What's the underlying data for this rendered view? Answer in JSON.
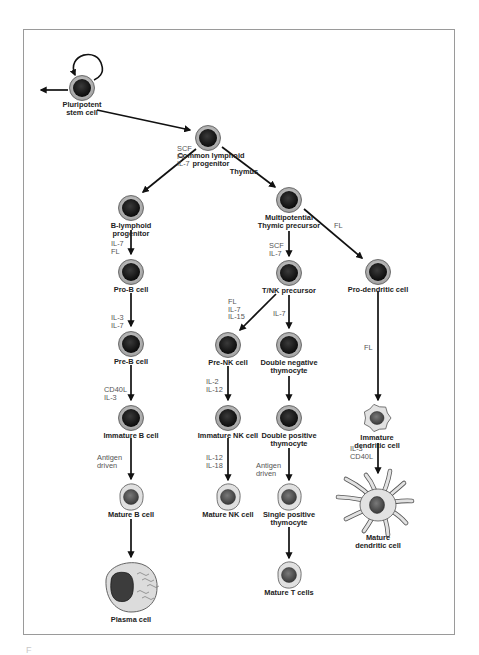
{
  "figure": {
    "caption_partial": "F"
  },
  "cells": [
    {
      "id": "psc",
      "label_lines": [
        "Pluripotent",
        "stem cell"
      ],
      "type": "progenitor"
    },
    {
      "id": "clp",
      "label_lines": [
        "Common lymphoid",
        "progenitor"
      ],
      "type": "progenitor"
    },
    {
      "id": "blp",
      "label_lines": [
        "B-lymphoid",
        "progenitor"
      ],
      "type": "progenitor"
    },
    {
      "id": "prob",
      "label_lines": [
        "Pro-B cell"
      ],
      "type": "progenitor"
    },
    {
      "id": "preb",
      "label_lines": [
        "Pre-B cell"
      ],
      "type": "progenitor"
    },
    {
      "id": "immb",
      "label_lines": [
        "Immature B cell"
      ],
      "type": "progenitor"
    },
    {
      "id": "matb",
      "label_lines": [
        "Mature B cell"
      ],
      "type": "mature"
    },
    {
      "id": "plasma",
      "label_lines": [
        "Plasma cell"
      ],
      "type": "plasma"
    },
    {
      "id": "mtp",
      "label_lines": [
        "Multipotential",
        "Thymic precursor"
      ],
      "type": "progenitor"
    },
    {
      "id": "tnk",
      "label_lines": [
        "T/NK precursor"
      ],
      "type": "progenitor"
    },
    {
      "id": "prenk",
      "label_lines": [
        "Pre-NK cell"
      ],
      "type": "progenitor"
    },
    {
      "id": "immnk",
      "label_lines": [
        "Immature NK cell"
      ],
      "type": "progenitor"
    },
    {
      "id": "matnk",
      "label_lines": [
        "Mature NK cell"
      ],
      "type": "mature"
    },
    {
      "id": "dnt",
      "label_lines": [
        "Double negative",
        "thymocyte"
      ],
      "type": "progenitor"
    },
    {
      "id": "dpt",
      "label_lines": [
        "Double positive",
        "thymocyte"
      ],
      "type": "progenitor"
    },
    {
      "id": "spt",
      "label_lines": [
        "Single positive",
        "thymocyte"
      ],
      "type": "mature"
    },
    {
      "id": "matt",
      "label_lines": [
        "Mature T cells"
      ],
      "type": "mature"
    },
    {
      "id": "prodc",
      "label_lines": [
        "Pro-dendritic cell"
      ],
      "type": "progenitor"
    },
    {
      "id": "immdc",
      "label_lines": [
        "Immature",
        "dendritic cell"
      ],
      "type": "immature-dc"
    },
    {
      "id": "matdc",
      "label_lines": [
        "Mature",
        "dendritic cell"
      ],
      "type": "mature-dc"
    }
  ],
  "transitions": [
    {
      "from": "psc",
      "to": "psc",
      "kind": "self-renewal",
      "factors": []
    },
    {
      "from": "psc",
      "to": "other-lineages",
      "kind": "exit",
      "factors": []
    },
    {
      "from": "psc",
      "to": "clp",
      "factors": []
    },
    {
      "from": "clp",
      "to": "blp",
      "factors": [
        "SCF",
        "FL",
        "IL-7"
      ]
    },
    {
      "from": "clp",
      "to": "mtp",
      "factors": [
        "Thymus"
      ]
    },
    {
      "from": "blp",
      "to": "prob",
      "factors": [
        "IL-7",
        "FL"
      ]
    },
    {
      "from": "prob",
      "to": "preb",
      "factors": [
        "IL-3",
        "IL-7"
      ]
    },
    {
      "from": "preb",
      "to": "immb",
      "factors": [
        "CD40L",
        "IL-3"
      ]
    },
    {
      "from": "immb",
      "to": "matb",
      "factors": [
        "Antigen",
        "driven"
      ]
    },
    {
      "from": "matb",
      "to": "plasma",
      "factors": []
    },
    {
      "from": "mtp",
      "to": "tnk",
      "factors": [
        "SCF",
        "IL-7"
      ]
    },
    {
      "from": "mtp",
      "to": "prodc",
      "factors": [
        "FL"
      ]
    },
    {
      "from": "tnk",
      "to": "prenk",
      "factors": [
        "FL",
        "IL-7",
        "IL-15"
      ]
    },
    {
      "from": "tnk",
      "to": "dnt",
      "factors": [
        "IL-7"
      ]
    },
    {
      "from": "prenk",
      "to": "immnk",
      "factors": [
        "IL-2",
        "IL-12"
      ]
    },
    {
      "from": "immnk",
      "to": "matnk",
      "factors": [
        "IL-12",
        "IL-18"
      ]
    },
    {
      "from": "dnt",
      "to": "dpt",
      "factors": []
    },
    {
      "from": "dpt",
      "to": "spt",
      "factors": [
        "Antigen",
        "driven"
      ]
    },
    {
      "from": "spt",
      "to": "matt",
      "factors": []
    },
    {
      "from": "prodc",
      "to": "immdc",
      "factors": [
        "FL"
      ]
    },
    {
      "from": "immdc",
      "to": "matdc",
      "factors": [
        "IL-3",
        "CD40L"
      ]
    }
  ],
  "colors": {
    "frame": "#9a9a9a",
    "arrow": "#111111",
    "nucleus": "#141414",
    "ring": "#a8a8a8",
    "mature_cytoplasm": "#d9d9d9",
    "mature_nucleus": "#555555",
    "label": "#222222",
    "cytokine": "#555555"
  }
}
